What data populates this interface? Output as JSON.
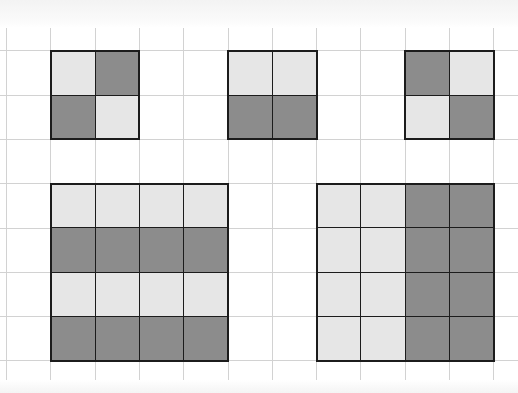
{
  "diagram": {
    "title": "",
    "colors": {
      "background": "#ffffff",
      "grid_line": "#d2d2d2",
      "light": "#e6e6e6",
      "dark": "#8c8c8c",
      "outline": "#1c1c1c"
    },
    "grid": {
      "origin_x": 6,
      "origin_y": 6,
      "pitch": 44.3,
      "columns": 12,
      "rows": 9
    },
    "shapes": [
      {
        "name": "square-2x2-diagonal-a",
        "col": 1,
        "row": 1,
        "cells": [
          [
            "L",
            "D"
          ],
          [
            "D",
            "L"
          ]
        ]
      },
      {
        "name": "square-2x2-bottom-dark",
        "col": 5,
        "row": 1,
        "cells": [
          [
            "L",
            "L"
          ],
          [
            "D",
            "D"
          ]
        ]
      },
      {
        "name": "square-2x2-diagonal-b",
        "col": 9,
        "row": 1,
        "cells": [
          [
            "D",
            "L"
          ],
          [
            "L",
            "D"
          ]
        ]
      },
      {
        "name": "square-4x4-horizontal-stripes",
        "col": 1,
        "row": 4,
        "cells": [
          [
            "L",
            "L",
            "L",
            "L"
          ],
          [
            "D",
            "D",
            "D",
            "D"
          ],
          [
            "L",
            "L",
            "L",
            "L"
          ],
          [
            "D",
            "D",
            "D",
            "D"
          ]
        ]
      },
      {
        "name": "square-4x4-vertical-halves",
        "col": 7,
        "row": 4,
        "cells": [
          [
            "L",
            "L",
            "D",
            "D"
          ],
          [
            "L",
            "L",
            "D",
            "D"
          ],
          [
            "L",
            "L",
            "D",
            "D"
          ],
          [
            "L",
            "L",
            "D",
            "D"
          ]
        ]
      }
    ]
  }
}
